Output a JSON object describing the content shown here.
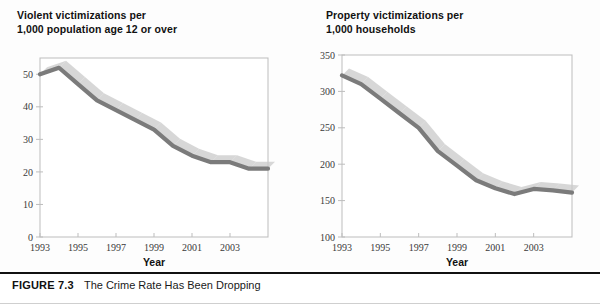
{
  "figure": {
    "caption_label": "FIGURE 7.3",
    "caption_text": "The Crime Rate Has Been Dropping"
  },
  "colors": {
    "line": "#7b7b7b",
    "shadow": "#c9c9c9",
    "frame": "#bdbdbd",
    "tick_text": "#3a3a3a",
    "title_text": "#111111"
  },
  "panels": {
    "left": {
      "title": "Violent victimizations per\n1,000 population age 12 or over"
    },
    "right": {
      "title": "Property victimizations per\n1,000 households"
    }
  },
  "chart_data": [
    {
      "type": "line",
      "title": "Violent victimizations per 1,000 population age 12 or over",
      "xlabel": "Year",
      "ylabel": "",
      "xlim": [
        1993,
        2005
      ],
      "ylim": [
        0,
        55
      ],
      "yticks": [
        0,
        10,
        20,
        30,
        40,
        50
      ],
      "ytick_labels": [
        "0",
        "10",
        "20",
        "30",
        "40",
        "50"
      ],
      "xticks": [
        1993,
        1995,
        1997,
        1999,
        2001,
        2003
      ],
      "xtick_labels": [
        "1993",
        "1995",
        "1997",
        "1999",
        "2001",
        "2003"
      ],
      "grid": false,
      "legend": "none",
      "x": [
        1993,
        1994,
        1995,
        1996,
        1997,
        1998,
        1999,
        2000,
        2001,
        2002,
        2003,
        2004,
        2005
      ],
      "values": [
        50,
        52,
        47,
        42,
        39,
        36,
        33,
        28,
        25,
        23,
        23,
        21,
        21
      ]
    },
    {
      "type": "line",
      "title": "Property victimizations per 1,000 households",
      "xlabel": "Year",
      "ylabel": "",
      "xlim": [
        1993,
        2005
      ],
      "ylim": [
        100,
        350
      ],
      "yticks": [
        100,
        150,
        200,
        250,
        300,
        350
      ],
      "ytick_labels": [
        "100",
        "150",
        "200",
        "250",
        "300",
        "350"
      ],
      "xticks": [
        1993,
        1995,
        1997,
        1999,
        2001,
        2003
      ],
      "xtick_labels": [
        "1993",
        "1995",
        "1997",
        "1999",
        "2001",
        "2003"
      ],
      "grid": false,
      "legend": "none",
      "x": [
        1993,
        1994,
        1995,
        1996,
        1997,
        1998,
        1999,
        2000,
        2001,
        2002,
        2003,
        2004,
        2005
      ],
      "values": [
        322,
        310,
        290,
        270,
        250,
        218,
        198,
        178,
        167,
        159,
        166,
        164,
        161
      ]
    }
  ]
}
